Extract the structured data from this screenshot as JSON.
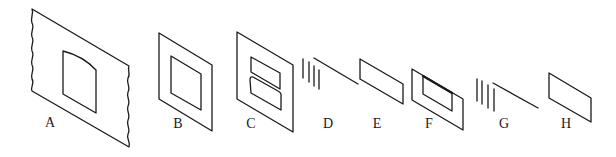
{
  "figure": {
    "panels": [
      {
        "id": "A",
        "label": "A",
        "description": "large sheet with wavy torn left and right edges and an inner window with curved top"
      },
      {
        "id": "B",
        "label": "B",
        "description": "parallelogram frame with inner parallelogram window"
      },
      {
        "id": "C",
        "label": "C",
        "description": "parallelogram frame with two stacked inner windows"
      },
      {
        "id": "D",
        "label": "D",
        "description": "four short vertical strokes and a diagonal line"
      },
      {
        "id": "E",
        "label": "E",
        "description": "flat parallelogram"
      },
      {
        "id": "F",
        "label": "F",
        "description": "parallelogram frame with inner window, thick top edge"
      },
      {
        "id": "G",
        "label": "G",
        "description": "four short vertical strokes and a diagonal line"
      },
      {
        "id": "H",
        "label": "H",
        "description": "flat parallelogram"
      }
    ],
    "stroke_color": "#1a1a1a",
    "background_color": "#ffffff"
  }
}
